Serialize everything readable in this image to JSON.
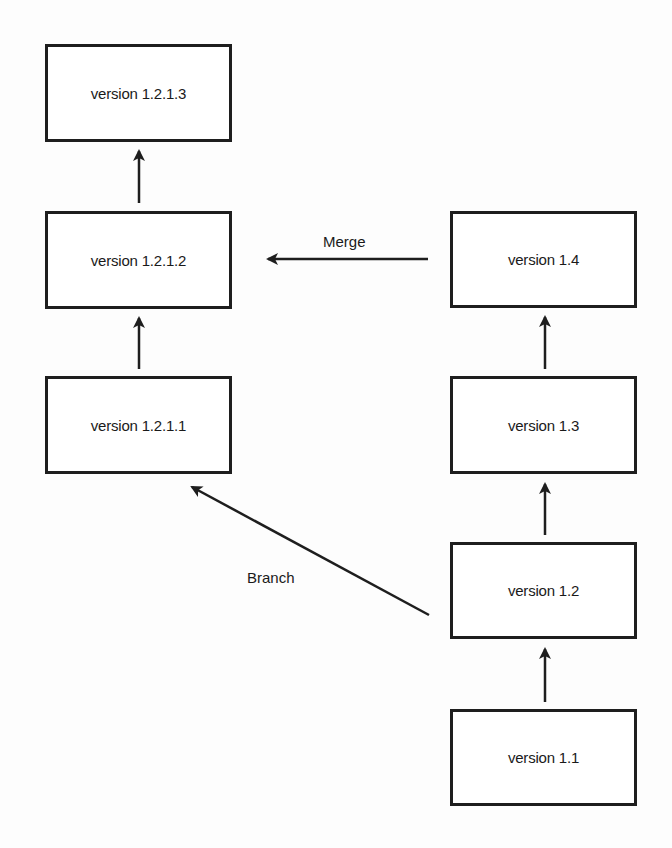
{
  "diagram": {
    "nodes": [
      {
        "id": "v1213",
        "label": "version 1.2.1.3"
      },
      {
        "id": "v1212",
        "label": "version 1.2.1.2"
      },
      {
        "id": "v1211",
        "label": "version 1.2.1.1"
      },
      {
        "id": "v14",
        "label": "version 1.4"
      },
      {
        "id": "v13",
        "label": "version 1.3"
      },
      {
        "id": "v12",
        "label": "version 1.2"
      },
      {
        "id": "v11",
        "label": "version 1.1"
      }
    ],
    "edges": [
      {
        "from": "v1211",
        "to": "v1212",
        "label": ""
      },
      {
        "from": "v1212",
        "to": "v1213",
        "label": ""
      },
      {
        "from": "v11",
        "to": "v12",
        "label": ""
      },
      {
        "from": "v12",
        "to": "v13",
        "label": ""
      },
      {
        "from": "v13",
        "to": "v14",
        "label": ""
      },
      {
        "from": "v14",
        "to": "v1212",
        "label": "Merge"
      },
      {
        "from": "v12",
        "to": "v1211",
        "label": "Branch"
      }
    ],
    "labels": {
      "merge": "Merge",
      "branch": "Branch"
    },
    "colors": {
      "stroke": "#1e1e1e",
      "background": "#fdfdfd"
    }
  }
}
